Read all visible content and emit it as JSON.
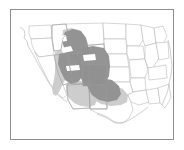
{
  "figure": {
    "type": "distribution-range-map",
    "region_label": "United States",
    "frame": {
      "visible": true,
      "color": "#8e8e8e"
    },
    "background_color": "#ffffff"
  },
  "legend_colors": {
    "primary_range": "#919191",
    "secondary_range": "#cacaca",
    "state_border": "#b4b4b4",
    "coastline": "#b0b0b0",
    "frame_border": "#8e8e8e",
    "land_fill": "#ffffff"
  },
  "map": {
    "projection_note": "conterminous-united-states",
    "base_outline_path": "M 8 18 L 13 21 L 15 25 L 14 30 L 17 33 L 19 38 L 22 43 L 24 49 L 26 55 L 28 60 L 31 64 L 34 68 L 37 72 L 40 76 L 42 80 L 45 84 L 47 88 L 50 93 L 53 97 L 56 100 L 59 103 L 63 105 L 67 107 L 70 109 L 74 110 L 78 111 L 82 112 L 86 113 L 90 113 L 94 112 L 98 112 L 102 113 L 106 114 L 110 115 L 114 114 L 118 112 L 122 110 L 126 107 L 130 104 L 134 101 L 138 98 L 141 94 L 144 90 L 146 85 L 148 80 L 150 75 L 152 70 L 153 64 L 154 58 L 155 52 L 156 46 L 157 40 L 157 34 L 156 28 L 155 22 L 153 17 L 150 14 L 145 13 L 138 13 L 130 13 L 120 13 L 110 13 L 100 13 L 90 13 L 80 13 L 70 13 L 60 13 L 50 13 L 40 13 L 30 13 L 22 14 L 16 15 Z",
    "states": [
      {
        "name": "washington",
        "path": "M 18 16 L 40 15 L 41 28 L 20 29 L 18 24 Z"
      },
      {
        "name": "oregon",
        "path": "M 20 29 L 41 28 L 43 45 L 28 47 L 24 42 L 21 35 Z"
      },
      {
        "name": "california",
        "path": "M 24 42 L 28 47 L 43 45 L 47 63 L 52 75 L 56 85 L 52 88 L 45 82 L 38 72 L 33 62 L 28 52 Z"
      },
      {
        "name": "idaho",
        "path": "M 41 15 L 55 14 L 57 23 L 52 28 L 50 40 L 43 41 L 41 28 Z"
      },
      {
        "name": "nevada",
        "path": "M 43 45 L 56 44 L 62 72 L 52 75 L 47 63 Z"
      },
      {
        "name": "utah",
        "path": "M 56 44 L 70 43 L 71 53 L 78 53 L 78 73 L 62 74 Z"
      },
      {
        "name": "arizona",
        "path": "M 56 75 L 78 74 L 79 98 L 62 99 L 57 90 Z"
      },
      {
        "name": "montana",
        "path": "M 55 14 L 92 13 L 93 34 L 70 36 L 57 33 Z"
      },
      {
        "name": "wyoming",
        "path": "M 70 36 L 93 34 L 94 54 L 71 55 Z"
      },
      {
        "name": "colorado",
        "path": "M 71 55 L 94 54 L 95 75 L 78 75 L 78 73 Z"
      },
      {
        "name": "new-mexico",
        "path": "M 78 75 L 95 75 L 96 99 L 79 99 Z"
      },
      {
        "name": "north-dakota",
        "path": "M 92 13 L 115 14 L 115 29 L 93 29 Z"
      },
      {
        "name": "south-dakota",
        "path": "M 93 29 L 115 29 L 116 44 L 94 44 Z"
      },
      {
        "name": "nebraska",
        "path": "M 94 44 L 116 44 L 118 57 L 95 57 Z"
      },
      {
        "name": "kansas",
        "path": "M 95 57 L 118 57 L 119 72 L 95 72 Z"
      },
      {
        "name": "oklahoma",
        "path": "M 95 72 L 119 72 L 122 82 L 117 85 L 97 85 L 96 78 Z"
      },
      {
        "name": "texas",
        "path": "M 79 99 L 96 99 L 97 85 L 117 85 L 120 92 L 122 100 L 118 108 L 112 113 L 104 113 L 98 108 L 92 105 L 86 103 L 82 101 Z"
      },
      {
        "name": "minnesota",
        "path": "M 115 14 L 130 15 L 132 30 L 128 36 L 116 36 L 115 29 Z"
      },
      {
        "name": "iowa",
        "path": "M 116 36 L 132 36 L 134 49 L 118 50 L 116 44 Z"
      },
      {
        "name": "missouri",
        "path": "M 118 50 L 134 49 L 137 60 L 134 68 L 120 68 L 119 58 Z"
      },
      {
        "name": "arkansas",
        "path": "M 120 68 L 134 68 L 135 80 L 122 82 L 119 72 Z"
      },
      {
        "name": "louisiana",
        "path": "M 122 82 L 135 80 L 138 92 L 128 95 L 120 92 L 117 85 Z"
      },
      {
        "name": "wisconsin",
        "path": "M 130 15 L 143 18 L 145 33 L 134 36 L 132 30 Z"
      },
      {
        "name": "illinois",
        "path": "M 134 36 L 145 33 L 148 48 L 142 58 L 137 58 L 134 49 Z"
      },
      {
        "name": "michigan",
        "path": "M 143 18 L 152 16 L 156 26 L 152 34 L 145 33 Z"
      },
      {
        "name": "indiana-ohio",
        "path": "M 145 33 L 157 32 L 158 48 L 148 50 Z"
      },
      {
        "name": "kentucky-tennessee",
        "path": "M 137 58 L 155 55 L 156 68 L 138 70 Z"
      },
      {
        "name": "mississippi-alabama",
        "path": "M 135 80 L 147 78 L 149 93 L 138 94 Z"
      },
      {
        "name": "southeast",
        "path": "M 147 78 L 158 74 L 160 88 L 154 98 L 149 93 Z"
      }
    ],
    "coastlines": [
      {
        "name": "pacific-northwest-coast",
        "path": "M 9 17 L 13 20 L 14 24 L 13 28 L 16 31 L 17 36 L 20 41"
      },
      {
        "name": "california-coast",
        "path": "M 20 41 L 23 46 L 26 52 L 30 59 L 34 66 L 38 73 L 43 80 L 48 86 L 53 90 L 56 92"
      },
      {
        "name": "gulf-coast",
        "path": "M 86 104 L 94 107 L 101 111 L 108 113 L 114 112 L 120 109 L 126 105 L 132 101 L 137 97"
      },
      {
        "name": "east-coast",
        "path": "M 157 30 L 159 38 L 160 47 L 161 56 L 160 65 L 158 73 L 157 80 L 154 88 L 151 95"
      }
    ],
    "range_polygons": [
      {
        "name": "secondary-range-west",
        "tier": "secondary",
        "path": "M 44 42 L 50 40 L 55 42 L 58 50 L 58 60 L 55 68 L 51 76 L 48 82 L 45 86 L 42 84 L 41 78 L 43 70 L 44 62 L 44 52 Z"
      },
      {
        "name": "secondary-range-southwest",
        "tier": "secondary",
        "path": "M 57 72 L 66 70 L 74 72 L 80 76 L 84 82 L 86 89 L 84 95 L 78 97 L 70 96 L 63 93 L 58 88 L 55 82 L 55 76 Z"
      },
      {
        "name": "secondary-range-south-plains",
        "tier": "secondary",
        "path": "M 80 76 L 92 74 L 103 75 L 112 79 L 117 85 L 116 92 L 110 95 L 100 96 L 90 94 L 83 90 L 79 84 Z"
      },
      {
        "name": "secondary-range-north",
        "tier": "secondary",
        "path": "M 52 20 L 60 18 L 68 20 L 74 26 L 77 34 L 75 42 L 68 44 L 60 42 L 54 36 L 51 28 Z"
      },
      {
        "name": "primary-range-idaho-montana",
        "tier": "primary",
        "path": "M 54 22 L 62 19 L 70 21 L 75 28 L 77 36 L 79 44 L 76 50 L 70 52 L 63 50 L 57 45 L 53 38 L 51 30 Z"
      },
      {
        "name": "primary-range-nevada-utah",
        "tier": "primary",
        "path": "M 48 44 L 56 42 L 64 44 L 70 50 L 73 58 L 72 66 L 67 72 L 60 74 L 54 70 L 50 62 L 47 54 Z"
      },
      {
        "name": "primary-range-wyoming-colorado",
        "tier": "primary",
        "path": "M 70 38 L 82 36 L 93 38 L 98 46 L 99 56 L 98 66 L 94 74 L 86 78 L 77 77 L 71 71 L 68 62 L 67 50 Z"
      },
      {
        "name": "primary-range-new-mexico",
        "tier": "primary",
        "path": "M 78 70 L 90 68 L 101 70 L 108 76 L 110 84 L 106 90 L 97 92 L 88 90 L 81 85 L 77 78 Z"
      },
      {
        "name": "primary-range-colorado-block",
        "tier": "primary",
        "path": "M 71 55 L 95 54 L 96 75 L 72 76 Z"
      }
    ],
    "overlay_state_lines": [
      {
        "name": "colorado-overlay",
        "path": "M 71 55 L 95 54 L 96 75 L 72 76 Z"
      },
      {
        "name": "wyoming-overlay",
        "path": "M 70 36 L 93 34 L 94 54 L 71 55 Z"
      },
      {
        "name": "utah-overlay",
        "path": "M 56 44 L 70 43 L 71 53 L 78 53 L 78 73 L 62 74 Z"
      },
      {
        "name": "new-mexico-overlay",
        "path": "M 78 75 L 95 75 L 96 99 L 79 99 Z"
      },
      {
        "name": "nevada-overlay",
        "path": "M 43 45 L 56 44 L 62 72 L 52 75 L 47 63 Z"
      },
      {
        "name": "idaho-overlay",
        "path": "M 41 15 L 55 14 L 57 23 L 52 28 L 50 40 L 43 41 L 41 28 Z"
      },
      {
        "name": "arizona-overlay",
        "path": "M 56 75 L 78 74 L 79 98 L 62 99 L 57 90 Z"
      }
    ],
    "white_gaps": [
      {
        "name": "gap-snake-river-plain",
        "path": "M 50 38 L 60 36 L 62 41 L 52 43 Z"
      },
      {
        "name": "gap-wyoming-basin",
        "path": "M 72 45 L 84 44 L 85 50 L 73 51 Z"
      },
      {
        "name": "gap-nevada-interior",
        "path": "M 55 56 L 68 55 L 69 60 L 56 61 Z"
      },
      {
        "name": "gap-north-idaho",
        "path": "M 48 26 L 55 25 L 56 31 L 49 32 Z"
      }
    ]
  }
}
